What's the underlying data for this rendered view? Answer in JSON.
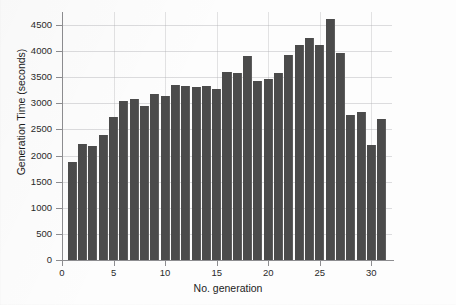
{
  "chart_data": {
    "type": "bar",
    "title": "",
    "subtitle": "",
    "xlabel": "No. generation",
    "ylabel": "Generation Time (seconds)",
    "xlim": [
      0,
      32
    ],
    "ylim": [
      0,
      4750
    ],
    "grid": true,
    "legend": null,
    "bar_color": "#4b4b4b",
    "axis_color": "#8d8d90",
    "background_color": "#fdfdfd",
    "y_ticks": [
      0,
      500,
      1000,
      1500,
      2000,
      2500,
      3000,
      3500,
      4000,
      4500
    ],
    "y_tick_labels": [
      "0",
      "500",
      "1000",
      "1500",
      "2000",
      "2500",
      "3000",
      "3500",
      "4000",
      "4500"
    ],
    "x_ticks": [
      0,
      5,
      10,
      15,
      20,
      25,
      30
    ],
    "x_tick_labels": [
      "0",
      "5",
      "10",
      "15",
      "20",
      "25",
      "30"
    ],
    "categories": [
      1,
      2,
      3,
      4,
      5,
      6,
      7,
      8,
      9,
      10,
      11,
      12,
      13,
      14,
      15,
      16,
      17,
      18,
      19,
      20,
      21,
      22,
      23,
      24,
      25,
      26,
      27,
      28,
      29,
      30,
      31
    ],
    "values": [
      1870,
      2220,
      2190,
      2400,
      2730,
      3050,
      3080,
      2950,
      3180,
      3140,
      3350,
      3330,
      3320,
      3330,
      3270,
      3610,
      3580,
      3900,
      3420,
      3460,
      3580,
      3930,
      4120,
      4250,
      4120,
      4620,
      3960,
      2780,
      2830,
      2210,
      2700
    ]
  },
  "figure": {
    "name": "generation-time-bar-chart"
  }
}
